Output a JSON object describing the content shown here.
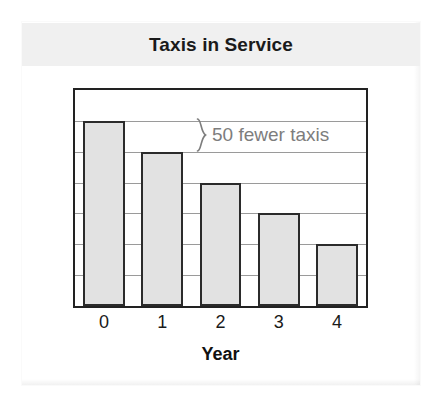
{
  "card": {
    "title": "Taxis in Service"
  },
  "annotation": {
    "text": "50 fewer taxis",
    "brace_icon": "curly-brace-icon"
  },
  "chart_data": {
    "type": "bar",
    "title": "Taxis in Service",
    "xlabel": "Year",
    "ylabel": "Number of taxis",
    "categories": [
      "0",
      "1",
      "2",
      "3",
      "4"
    ],
    "values": [
      300,
      250,
      200,
      150,
      100
    ],
    "ylim": [
      0,
      350
    ],
    "y_gridline_step": 50,
    "y_tick_labels": [],
    "grid": true,
    "legend": null,
    "bar_fill_color": "#e2e2e2",
    "bar_border_color": "#2b2b2b",
    "gridline_color": "#9a9a9a",
    "annotations": [
      {
        "text": "50 fewer taxis",
        "from_category": "0",
        "to_category": "1",
        "value_difference": 50,
        "color": "#7d7d7d"
      }
    ]
  }
}
